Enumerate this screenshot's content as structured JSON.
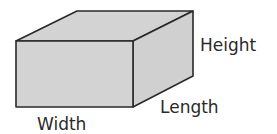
{
  "diagram": {
    "shape": "rectangular-prism",
    "fill_color": "#d3d3d3",
    "stroke_color": "#2a2a2a",
    "labels": {
      "height": "Height",
      "length": "Length",
      "width": "Width"
    }
  }
}
